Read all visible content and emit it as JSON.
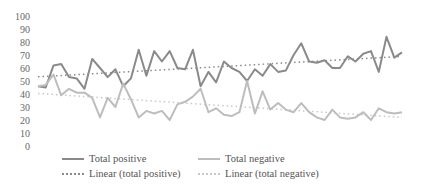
{
  "chart_data": {
    "type": "line",
    "title": "",
    "xlabel": "",
    "ylabel": "",
    "ylim": [
      0,
      100
    ],
    "yticks": [
      100,
      90,
      80,
      70,
      60,
      50,
      40,
      30,
      20,
      10,
      0
    ],
    "grid": false,
    "legend_position": "bottom",
    "series": [
      {
        "name": "Total positive",
        "color": "#8a8a8a",
        "values": [
          46,
          45,
          62,
          63,
          53,
          52,
          44,
          67,
          60,
          53,
          59,
          46,
          52,
          74,
          54,
          73,
          65,
          73,
          60,
          59,
          74,
          46,
          57,
          49,
          65,
          60,
          57,
          50,
          59,
          54,
          63,
          57,
          58,
          70,
          79,
          65,
          64,
          66,
          60,
          60,
          69,
          65,
          71,
          73,
          57,
          84,
          68,
          72
        ]
      },
      {
        "name": "Total negative",
        "color": "#bdbdbd",
        "values": [
          46,
          47,
          55,
          39,
          44,
          41,
          41,
          37,
          22,
          37,
          30,
          48,
          36,
          22,
          27,
          25,
          27,
          20,
          32,
          34,
          38,
          44,
          26,
          29,
          24,
          23,
          26,
          50,
          25,
          42,
          28,
          33,
          28,
          26,
          33,
          26,
          22,
          20,
          28,
          22,
          21,
          22,
          26,
          20,
          29,
          26,
          25,
          26
        ]
      },
      {
        "name": "Linear (total positive)",
        "color": "#8a8a8a",
        "style": "dotted",
        "trendline_of": "Total positive"
      },
      {
        "name": "Linear (total negative)",
        "color": "#c8c8c8",
        "style": "dotted",
        "trendline_of": "Total negative"
      }
    ]
  },
  "legend": [
    {
      "label": "Total positive",
      "style": "solid-dark"
    },
    {
      "label": "Total negative",
      "style": "solid-light"
    },
    {
      "label": "Linear (total positive)",
      "style": "dot-dark"
    },
    {
      "label": "Linear (total negative)",
      "style": "dot-light"
    }
  ]
}
